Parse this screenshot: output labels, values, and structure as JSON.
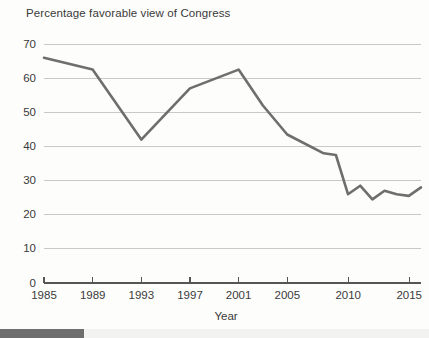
{
  "chart_data": {
    "type": "line",
    "title": "Percentage favorable view of Congress",
    "xlabel": "Year",
    "ylabel": "",
    "xlim": [
      1985,
      2016
    ],
    "ylim": [
      0,
      70
    ],
    "grid": true,
    "legend": "none",
    "xticks": [
      "1985",
      "1989",
      "1993",
      "1997",
      "2001",
      "2005",
      "2010",
      "2015"
    ],
    "xtick_values": [
      1985,
      1989,
      1993,
      1997,
      2001,
      2005,
      2010,
      2015
    ],
    "yticks": [
      "0",
      "10",
      "20",
      "30",
      "40",
      "50",
      "60",
      "70"
    ],
    "ytick_values": [
      0,
      10,
      20,
      30,
      40,
      50,
      60,
      70
    ],
    "series": [
      {
        "name": "Percentage favorable view of Congress",
        "color": "#6e6e6e",
        "x": [
          1985,
          1989,
          1993,
          1997,
          2001,
          2003,
          2005,
          2008,
          2009,
          2010,
          2011,
          2012,
          2013,
          2014,
          2015,
          2016
        ],
        "values": [
          66,
          62.5,
          42,
          57,
          62.5,
          52,
          43.5,
          38,
          37.5,
          26,
          28.5,
          24.5,
          27,
          26,
          25.5,
          28
        ]
      }
    ]
  },
  "footer": {
    "scroll_thumb": ""
  }
}
